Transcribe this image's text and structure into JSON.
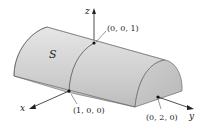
{
  "figure": {
    "surface_label": "S",
    "axes": {
      "x": "x",
      "y": "y",
      "z": "z"
    },
    "points": [
      {
        "label": "(0, 0, 1)"
      },
      {
        "label": "(1, 0, 0)"
      },
      {
        "label": "(0, 2, 0)"
      }
    ],
    "colors": {
      "surface_light": "#dcdcdc",
      "surface_dark": "#b4b4b4",
      "end_cap": "#c4c4c4",
      "outline": "#555555",
      "axis": "#222222",
      "point": "#111111"
    }
  }
}
